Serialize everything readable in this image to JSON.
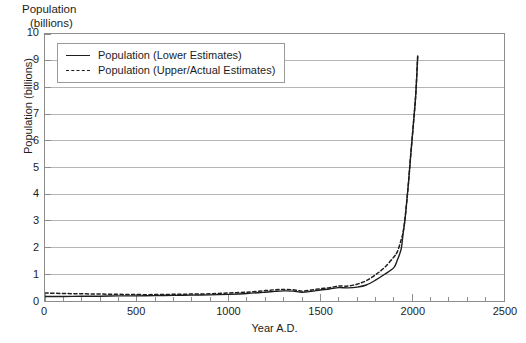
{
  "header": {
    "line1": "Population",
    "line2": "(billions)"
  },
  "axes": {
    "y_title": "Population (billions)",
    "x_title": "Year A.D.",
    "y_ticks": [
      "10",
      "9",
      "8",
      "7",
      "6",
      "5",
      "4",
      "3",
      "2",
      "1",
      "0"
    ],
    "x_ticks": [
      "0",
      "500",
      "1000",
      "1500",
      "2000",
      "2500"
    ]
  },
  "legend": {
    "items": [
      {
        "label": "Population (Lower Estimates)",
        "style": "solid",
        "color": "#1d1d1d"
      },
      {
        "label": "Population (Upper/Actual Estimates)",
        "style": "dashed",
        "color": "#1d1d1d"
      }
    ]
  },
  "colors": {
    "line": "#1d1d1d",
    "grid": "#b4b4b4",
    "frame": "#8c8c8c",
    "background": "#ffffff"
  },
  "chart_data": {
    "type": "line",
    "title": "Population (billions)",
    "xlabel": "Year A.D.",
    "ylabel": "Population (billions)",
    "xlim": [
      0,
      2500
    ],
    "ylim": [
      0,
      10
    ],
    "grid": true,
    "grid_axis": "y",
    "x_major_tick_step": 500,
    "x_minor_tick_step": 100,
    "y_major_tick_step": 1,
    "legend_position": "upper left",
    "series": [
      {
        "name": "Population (Lower Estimates)",
        "style": "solid",
        "x": [
          0,
          100,
          200,
          300,
          400,
          500,
          600,
          700,
          800,
          900,
          1000,
          1100,
          1200,
          1250,
          1300,
          1350,
          1400,
          1450,
          1500,
          1550,
          1600,
          1650,
          1700,
          1750,
          1800,
          1850,
          1900,
          1920,
          1940,
          1950,
          1960,
          1970,
          1980,
          1990,
          2000,
          2010,
          2020,
          2030
        ],
        "y": [
          0.17,
          0.17,
          0.18,
          0.18,
          0.19,
          0.19,
          0.2,
          0.21,
          0.22,
          0.23,
          0.25,
          0.28,
          0.33,
          0.36,
          0.38,
          0.37,
          0.33,
          0.36,
          0.41,
          0.45,
          0.5,
          0.49,
          0.52,
          0.6,
          0.78,
          1.0,
          1.25,
          1.55,
          1.95,
          2.5,
          3.0,
          3.7,
          4.45,
          5.3,
          6.1,
          6.9,
          7.8,
          9.15
        ]
      },
      {
        "name": "Population (Upper/Actual Estimates)",
        "style": "dashed",
        "x": [
          0,
          100,
          200,
          300,
          400,
          500,
          600,
          700,
          800,
          900,
          1000,
          1100,
          1200,
          1250,
          1300,
          1350,
          1400,
          1450,
          1500,
          1550,
          1600,
          1650,
          1700,
          1750,
          1800,
          1850,
          1900,
          1920,
          1940,
          1950,
          1960,
          1970,
          1980,
          1990,
          2000,
          2010,
          2020,
          2030
        ],
        "y": [
          0.3,
          0.28,
          0.27,
          0.26,
          0.25,
          0.24,
          0.24,
          0.25,
          0.26,
          0.27,
          0.3,
          0.33,
          0.39,
          0.42,
          0.43,
          0.42,
          0.37,
          0.41,
          0.46,
          0.5,
          0.56,
          0.56,
          0.63,
          0.76,
          0.98,
          1.26,
          1.65,
          1.86,
          2.3,
          2.56,
          3.04,
          3.71,
          4.45,
          5.32,
          6.12,
          6.93,
          7.8,
          9.2
        ]
      }
    ],
    "annotations": [
      {
        "text": "Plague dip near 1400",
        "x": 1400
      },
      {
        "text": "Exponential rise after 1900",
        "x": 1900
      }
    ]
  }
}
